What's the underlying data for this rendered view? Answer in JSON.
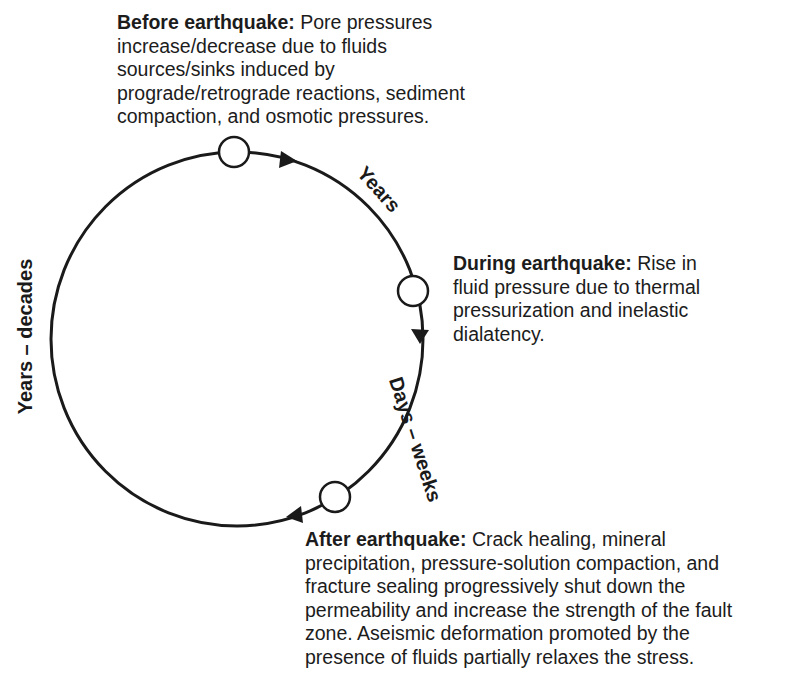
{
  "diagram": {
    "type": "cycle",
    "title": "",
    "stages": [
      {
        "id": "before",
        "heading": "Before earthquake:",
        "body": "Pore pressures increase/decrease due to fluids sources/sinks induced by prograde/retrograde reactions, sediment compaction, and osmotic pressures.",
        "lines": [
          "Pore pressures",
          "increase/decrease due to fluids",
          "sources/sinks induced by",
          "prograde/retrograde reactions, sediment",
          "compaction, and osmotic pressures."
        ]
      },
      {
        "id": "during",
        "heading": "During earthquake:",
        "body": "Rise in fluid pressure due to thermal pressurization and inelastic dialatency.",
        "lines": [
          "Rise in",
          "fluid pressure due to thermal",
          "pressurization and inelastic",
          "dialatency."
        ]
      },
      {
        "id": "after",
        "heading": "After earthquake:",
        "body": "Crack healing, mineral precipitation, pressure-solution compaction, and fracture sealing progressively shut down the permeability and increase the strength of the fault zone. Aseismic deformation promoted by the presence of fluids partially relaxes the stress.",
        "lines": [
          "Crack healing, mineral",
          "precipitation, pressure-solution compaction, and",
          "fracture sealing progressively shut down the",
          "permeability and increase the strength of the fault",
          "zone. Aseismic deformation promoted by the",
          "presence of fluids partially relaxes the stress."
        ]
      }
    ],
    "transitions": [
      {
        "from": "before",
        "to": "during",
        "duration": "Years"
      },
      {
        "from": "during",
        "to": "after",
        "duration": "Days – weeks"
      },
      {
        "from": "after",
        "to": "before",
        "duration": "Years – decades"
      }
    ],
    "colors": {
      "line": "#1a1a1a",
      "node_fill": "#ffffff",
      "background": "#ffffff"
    }
  }
}
